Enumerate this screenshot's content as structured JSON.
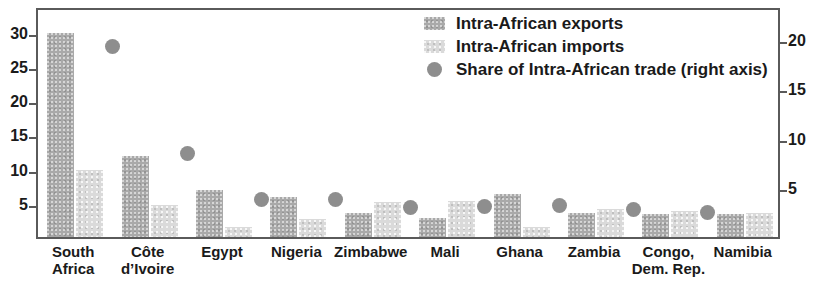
{
  "chart_data": {
    "type": "bar",
    "title": "",
    "subtitle": "",
    "xlabel": "",
    "ylabel": "",
    "categories": [
      "South Africa",
      "Côte d’Ivoire",
      "Egypt",
      "Nigeria",
      "Zimbabwe",
      "Mali",
      "Ghana",
      "Zambia",
      "Congo, Dem. Rep.",
      "Namibia"
    ],
    "category_lines": [
      [
        "South",
        "Africa"
      ],
      [
        "Côte",
        "d’Ivoire"
      ],
      [
        "Egypt",
        ""
      ],
      [
        "Nigeria",
        ""
      ],
      [
        "Zimbabwe",
        ""
      ],
      [
        "Mali",
        ""
      ],
      [
        "Ghana",
        ""
      ],
      [
        "Zambia",
        ""
      ],
      [
        "Congo,",
        "Dem. Rep."
      ],
      [
        "Namibia",
        ""
      ]
    ],
    "series": [
      {
        "name": "Intra-African exports",
        "axis": "left",
        "type": "bar",
        "color": "#a9a9a9",
        "values": [
          29.9,
          11.8,
          6.9,
          5.9,
          3.5,
          2.8,
          6.3,
          3.5,
          3.4,
          3.4
        ]
      },
      {
        "name": "Intra-African imports",
        "axis": "left",
        "type": "bar",
        "color": "#dadada",
        "values": [
          9.8,
          4.7,
          1.4,
          2.7,
          5.1,
          5.3,
          1.5,
          4.1,
          3.8,
          3.5
        ]
      },
      {
        "name": "Share of Intra-African trade (right axis)",
        "axis": "right",
        "type": "scatter",
        "color": "#8e8e8e",
        "values": [
          19.6,
          8.8,
          4.2,
          4.2,
          3.4,
          3.5,
          3.6,
          3.2,
          2.9,
          null
        ]
      }
    ],
    "left_axis": {
      "ticks": [
        5,
        10,
        15,
        20,
        25,
        30
      ],
      "min": 0,
      "max": 33.8,
      "grid": false
    },
    "right_axis": {
      "ticks": [
        5,
        10,
        15,
        20
      ],
      "min": 0,
      "max": 23.3,
      "grid": false
    },
    "legend": {
      "position": "top-right",
      "entries": [
        {
          "label": "Intra-African exports",
          "marker": "swatch-dark"
        },
        {
          "label": "Intra-African imports",
          "marker": "swatch-light"
        },
        {
          "label": "Share of Intra-African trade (right axis)",
          "marker": "dot"
        }
      ]
    }
  }
}
